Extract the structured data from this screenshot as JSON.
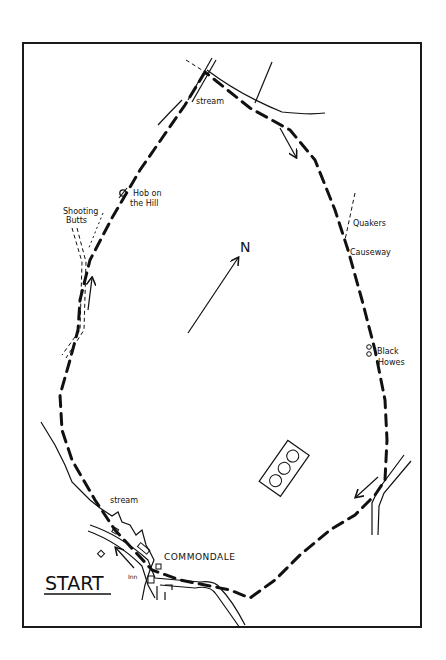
{
  "map": {
    "north_label": "N",
    "start_label": "START",
    "village_label": "Commondale",
    "inn_label": "Inn",
    "labels": {
      "stream_top": "stream",
      "stream_bottom": "stream",
      "hob_line1": "Hob on",
      "hob_line2": "the Hill",
      "shooting_line1": "Shooting",
      "shooting_line2": "Butts",
      "quakers_line1": "Quakers",
      "quakers_line2": "Causeway",
      "black_line1": "Black",
      "black_line2": "Howes"
    },
    "colors": {
      "ink": "#111111",
      "paper": "#ffffff",
      "frame": "#1a1a1a"
    }
  }
}
